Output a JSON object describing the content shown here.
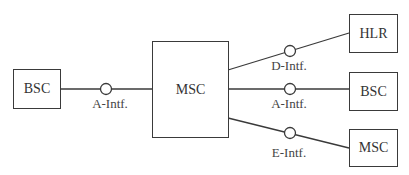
{
  "diagram": {
    "nodes": [
      {
        "id": "bsc-left",
        "label": "BSC"
      },
      {
        "id": "msc-center",
        "label": "MSC"
      },
      {
        "id": "hlr",
        "label": "HLR"
      },
      {
        "id": "bsc-right",
        "label": "BSC"
      },
      {
        "id": "msc-right",
        "label": "MSC"
      }
    ],
    "edges": [
      {
        "from": "bsc-left",
        "to": "msc-center",
        "label": "A-Intf."
      },
      {
        "from": "msc-center",
        "to": "hlr",
        "label": "D-Intf."
      },
      {
        "from": "msc-center",
        "to": "bsc-right",
        "label": "A-Intf."
      },
      {
        "from": "msc-center",
        "to": "msc-right",
        "label": "E-Intf."
      }
    ],
    "colors": {
      "stroke": "#3a3a3a",
      "text": "#333333",
      "background": "#ffffff"
    }
  }
}
